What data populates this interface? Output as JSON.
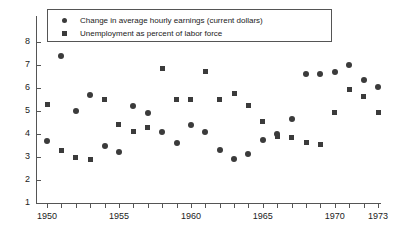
{
  "chart_data": {
    "type": "scatter",
    "title": "",
    "subtitle": "",
    "xlabel": "",
    "ylabel": "",
    "xlim": [
      1949.3,
      1973.8
    ],
    "ylim": [
      1,
      8.5
    ],
    "grid": false,
    "legend_position": "top-left-inside",
    "x_tick_step": 1,
    "x_tick_labels": [
      "1950",
      "1955",
      "1960",
      "1965",
      "1970",
      "1973"
    ],
    "x_tick_label_values": [
      1950,
      1955,
      1960,
      1965,
      1970,
      1973
    ],
    "y_tick_labels": [
      "1",
      "2",
      "3",
      "4",
      "5",
      "6",
      "7",
      "8"
    ],
    "y_tick_values": [
      1,
      2,
      3,
      4,
      5,
      6,
      7,
      8
    ],
    "x": [
      1950,
      1951,
      1952,
      1953,
      1954,
      1955,
      1956,
      1957,
      1958,
      1959,
      1960,
      1961,
      1962,
      1963,
      1964,
      1965,
      1966,
      1967,
      1968,
      1969,
      1970,
      1971,
      1972,
      1973
    ],
    "series": [
      {
        "name": "Change in average hourly earnings (current dollars)",
        "marker": "circle",
        "color": "#3b3b3b",
        "values": [
          3.7,
          7.4,
          5.0,
          5.7,
          3.5,
          3.2,
          5.2,
          4.9,
          4.1,
          3.6,
          4.4,
          4.1,
          3.3,
          2.9,
          3.15,
          3.75,
          4.0,
          4.65,
          6.6,
          6.6,
          6.7,
          7.0,
          6.35,
          6.05
        ]
      },
      {
        "name": "Unemployment as percent of labor force",
        "marker": "square",
        "color": "#3b3b3b",
        "values": [
          5.3,
          3.3,
          3.0,
          2.9,
          5.5,
          4.4,
          4.1,
          4.3,
          6.85,
          5.5,
          5.5,
          6.7,
          5.5,
          5.75,
          5.25,
          4.55,
          3.9,
          3.85,
          3.65,
          3.55,
          4.95,
          5.95,
          5.65,
          4.95
        ]
      }
    ]
  },
  "legend": {
    "entries": [
      {
        "label": "Change in average hourly earnings (current dollars)",
        "marker": "circle"
      },
      {
        "label": "Unemployment as percent of labor force",
        "marker": "square"
      }
    ]
  }
}
